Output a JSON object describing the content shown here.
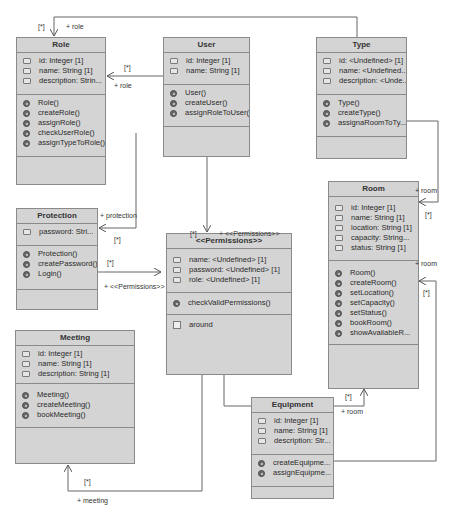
{
  "diagram": {
    "type": "UML class diagram",
    "classes": {
      "role": {
        "name": "Role",
        "attributes": [
          "id: Integer [1]",
          "name: String [1]",
          "description: Strin..."
        ],
        "operations": [
          "Role()",
          "createRole()",
          "assignRole()",
          "checkUserRole()",
          "assignTypeToRole()"
        ]
      },
      "user": {
        "name": "User",
        "attributes": [
          "id: Integer [1]",
          "name: String [1]"
        ],
        "operations": [
          "User()",
          "createUser()",
          "assignRoleToUser()"
        ]
      },
      "type": {
        "name": "Type",
        "attributes": [
          "id: <Undefined> [1]",
          "name: <Undefined...",
          "description: <Unde..."
        ],
        "operations": [
          "Type()",
          "createType()",
          "assignaRoomToTy..."
        ]
      },
      "protection": {
        "name": "Protection",
        "attributes": [
          "password: Stri..."
        ],
        "operations": [
          "Protection()",
          "createPassword()",
          "Login()"
        ]
      },
      "permissions": {
        "name": "<<Permissions>>",
        "attributes": [
          "name: <Undefined> [1]",
          "password: <Undefined> [1]",
          "role: <Undefined> [1]"
        ],
        "operations": [
          "checkValidPermissions()"
        ],
        "literals": [
          "around"
        ]
      },
      "room": {
        "name": "Room",
        "attributes": [
          "id: Integer [1]",
          "name: String [1]",
          "location: String [1]",
          "capacity: String...",
          "status: String [1]"
        ],
        "operations": [
          "Room()",
          "createRoom()",
          "setLocation()",
          "setCapacity()",
          "setStatus()",
          "bookRoom()",
          "showAvailableR..."
        ]
      },
      "meeting": {
        "name": "Meeting",
        "attributes": [
          "id: Integer [1]",
          "name: String [1]",
          "description: String [1]"
        ],
        "operations": [
          "Meeting()",
          "createMeeting()",
          "bookMeeting()"
        ]
      },
      "equipment": {
        "name": "Equipment",
        "attributes": [
          "id: Integer [1]",
          "name: String [1]",
          "description: Str..."
        ],
        "operations": [
          "createEquipme...",
          "assignEquipme..."
        ]
      }
    },
    "associations": {
      "type_role": {
        "multiplicity": "[*]",
        "role": "+ role"
      },
      "user_role": {
        "multiplicity": "[*]",
        "role": "+ role"
      },
      "user_protection": {
        "multiplicity": "[*]",
        "role": "+ protection"
      },
      "user_permissions": {
        "multiplicity": "[*]",
        "role": "+ <<Permissions>>"
      },
      "protection_permissions": {
        "multiplicity": "[*]",
        "role": "+ <<Permissions>>"
      },
      "type_room": {
        "multiplicity": "[*]",
        "role": "+ room"
      },
      "equipment_room": {
        "multiplicity": "[*]",
        "role": "+ room"
      },
      "permissions_room": {
        "multiplicity": "[*]",
        "role": "+ room"
      },
      "permissions_meeting": {
        "multiplicity": "[*]",
        "role": "+ meeting"
      }
    },
    "colors": {
      "box_fill": "#d4d4d4",
      "box_border": "#8a8a8a",
      "line": "#555555"
    }
  }
}
